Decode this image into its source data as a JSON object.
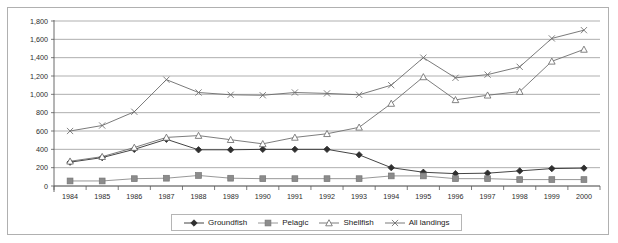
{
  "chart_data": {
    "type": "line",
    "title": "",
    "subtitle": "",
    "xlabel": "",
    "ylabel": "",
    "categories": [
      "1984",
      "1985",
      "1986",
      "1987",
      "1988",
      "1989",
      "1990",
      "1991",
      "1992",
      "1993",
      "1994",
      "1995",
      "1996",
      "1997",
      "1998",
      "1999",
      "2000"
    ],
    "ylim": [
      0,
      1800
    ],
    "yticks": [
      "0",
      "200",
      "400",
      "600",
      "800",
      "1,000",
      "1,200",
      "1,400",
      "1,600",
      "1,800"
    ],
    "ytick_values": [
      0,
      200,
      400,
      600,
      800,
      1000,
      1200,
      1400,
      1600,
      1800
    ],
    "grid": true,
    "legend_position": "bottom",
    "series": [
      {
        "name": "Groundfish",
        "marker": "diamond",
        "color": "#2f2f2f",
        "values": [
          260,
          310,
          400,
          510,
          395,
          395,
          400,
          400,
          400,
          340,
          200,
          150,
          135,
          140,
          165,
          190,
          195
        ]
      },
      {
        "name": "Pelagic",
        "marker": "square",
        "color": "#8c8c8c",
        "values": [
          55,
          55,
          80,
          85,
          115,
          85,
          80,
          80,
          80,
          80,
          110,
          110,
          80,
          80,
          70,
          70,
          70
        ]
      },
      {
        "name": "Shellfish",
        "marker": "triangle",
        "color": "#6e6e6e",
        "values": [
          270,
          320,
          420,
          530,
          550,
          505,
          460,
          530,
          570,
          640,
          900,
          1190,
          940,
          990,
          1030,
          1360,
          1490
        ]
      },
      {
        "name": "All landings",
        "marker": "cross",
        "color": "#6b6b6b",
        "values": [
          600,
          660,
          810,
          1160,
          1020,
          995,
          990,
          1020,
          1010,
          995,
          1100,
          1400,
          1180,
          1215,
          1300,
          1610,
          1700
        ]
      }
    ]
  },
  "legend": {
    "items": [
      {
        "label": "Groundfish",
        "marker": "diamond"
      },
      {
        "label": "Pelagic",
        "marker": "square"
      },
      {
        "label": "Shellfish",
        "marker": "triangle"
      },
      {
        "label": "All landings",
        "marker": "cross"
      }
    ]
  },
  "colors": {
    "frame_border": "#b0b0b0",
    "gridline": "#8d8d8d",
    "axis": "#5a5a5a",
    "text": "#2b2b2b",
    "background": "#ffffff"
  }
}
